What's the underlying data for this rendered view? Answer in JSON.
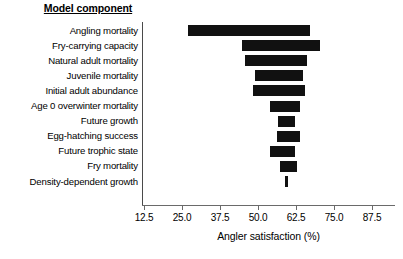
{
  "chart_data": {
    "type": "bar",
    "orientation": "horizontal",
    "title": "",
    "category_axis_title": "Model component",
    "xlabel": "Angler satisfaction (%)",
    "ylabel": "",
    "xlim": [
      12.5,
      87.5
    ],
    "xticks": [
      "12.5",
      "25.0",
      "37.5",
      "50.0",
      "62.5",
      "75.0",
      "87.5"
    ],
    "xtick_values": [
      12.5,
      25.0,
      37.5,
      50.0,
      62.5,
      75.0,
      87.5
    ],
    "grid": false,
    "legend": "none",
    "bar_color": "#111111",
    "categories": [
      "Angling mortality",
      "Fry-carrying capacity",
      "Natural adult mortality",
      "Juvenile mortality",
      "Initial adult abundance",
      "Age 0 overwinter mortality",
      "Future growth",
      "Egg-hatching success",
      "Future trophic state",
      "Fry mortality",
      "Density-dependent growth"
    ],
    "bars": [
      {
        "category": "Angling mortality",
        "low": 26.9,
        "high": 67.1,
        "span": 40.2
      },
      {
        "category": "Fry-carrying capacity",
        "low": 44.7,
        "high": 70.4,
        "span": 25.7
      },
      {
        "category": "Natural adult mortality",
        "low": 45.7,
        "high": 66.1,
        "span": 20.4
      },
      {
        "category": "Juvenile mortality",
        "low": 49.0,
        "high": 64.8,
        "span": 15.8
      },
      {
        "category": "Initial adult abundance",
        "low": 48.3,
        "high": 65.5,
        "span": 17.2
      },
      {
        "category": "Age 0 overwinter mortality",
        "low": 53.9,
        "high": 63.8,
        "span": 9.9
      },
      {
        "category": "Future growth",
        "low": 56.6,
        "high": 62.2,
        "span": 5.6
      },
      {
        "category": "Egg-hatching success",
        "low": 56.2,
        "high": 63.8,
        "span": 7.6
      },
      {
        "category": "Future trophic state",
        "low": 53.9,
        "high": 62.2,
        "span": 8.3
      },
      {
        "category": "Fry mortality",
        "low": 57.2,
        "high": 62.8,
        "span": 5.6
      },
      {
        "category": "Density-dependent growth",
        "low": 58.8,
        "high": 59.2,
        "span": 0.4
      }
    ]
  }
}
